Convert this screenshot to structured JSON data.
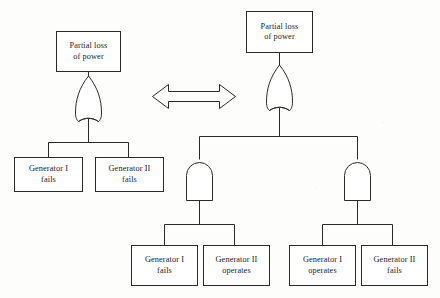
{
  "diagram": {
    "type": "fault-tree",
    "stroke_color": "#2a2a2a",
    "fill_color": "#ffffff",
    "background_color": "#fdfdfc",
    "equivalence_symbol": "double-headed-arrow"
  },
  "left_tree": {
    "top_event": {
      "label": "Partial loss\nof power"
    },
    "gate": {
      "type": "OR",
      "label": ""
    },
    "inputs": [
      {
        "label": "Generator I\nfails"
      },
      {
        "label": "Generator II\nfails"
      }
    ]
  },
  "right_tree": {
    "top_event": {
      "label": "Partial loss\nof power"
    },
    "gate": {
      "type": "OR",
      "label": ""
    },
    "branches": [
      {
        "gate": {
          "type": "AND",
          "label": ""
        },
        "inputs": [
          {
            "label": "Generator I\nfails"
          },
          {
            "label": "Generator II\noperates"
          }
        ]
      },
      {
        "gate": {
          "type": "AND",
          "label": ""
        },
        "inputs": [
          {
            "label": "Generator I\noperates"
          },
          {
            "label": "Generator II\nfails"
          }
        ]
      }
    ]
  }
}
